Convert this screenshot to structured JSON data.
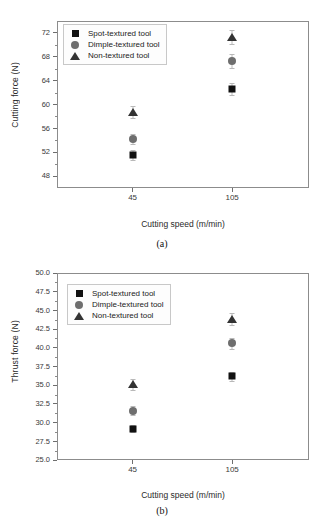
{
  "figure": {
    "panels": [
      {
        "caption": "(a)",
        "xlabel": "Cutting speed  (m/min)",
        "ylabel": "Cutting force (N)"
      },
      {
        "caption": "(b)",
        "xlabel": "Cutting speed  (m/min)",
        "ylabel": "Thrust force (N)"
      }
    ]
  },
  "legend": {
    "entries": [
      {
        "label": "Spot-textured tool",
        "marker": "square",
        "color": "#111111"
      },
      {
        "label": "Dimple-textured tool",
        "marker": "circle",
        "color": "#6e6e6e"
      },
      {
        "label": "Non-textured tool",
        "marker": "triangle",
        "color": "#333333"
      }
    ]
  },
  "chart_data": [
    {
      "type": "scatter",
      "panel": "(a)",
      "title": "",
      "xlabel": "Cutting speed  (m/min)",
      "ylabel": "Cutting force (N)",
      "categories": [
        "45",
        "105"
      ],
      "x": [
        45,
        105
      ],
      "xtick_labels": [
        "45",
        "105"
      ],
      "ytick_labels": [
        "48",
        "52",
        "56",
        "60",
        "64",
        "68",
        "72"
      ],
      "yticks": [
        48,
        52,
        56,
        60,
        64,
        68,
        72
      ],
      "ylim": [
        46,
        74
      ],
      "grid": false,
      "legend_position": "upper-left",
      "series": [
        {
          "name": "Spot-textured tool",
          "marker": "square",
          "color": "#111111",
          "values": [
            51.5,
            62.6
          ],
          "errors": [
            0.8,
            1.0
          ]
        },
        {
          "name": "Dimple-textured tool",
          "marker": "circle",
          "color": "#6e6e6e",
          "values": [
            54.2,
            67.3
          ],
          "errors": [
            0.9,
            1.1
          ]
        },
        {
          "name": "Non-textured tool",
          "marker": "triangle",
          "color": "#333333",
          "values": [
            58.8,
            71.3
          ],
          "errors": [
            1.0,
            1.2
          ]
        }
      ]
    },
    {
      "type": "scatter",
      "panel": "(b)",
      "title": "",
      "xlabel": "Cutting speed  (m/min)",
      "ylabel": "Thrust force (N)",
      "categories": [
        "45",
        "105"
      ],
      "x": [
        45,
        105
      ],
      "xtick_labels": [
        "45",
        "105"
      ],
      "ytick_labels": [
        "25.0",
        "27.5",
        "30.0",
        "32.5",
        "35.0",
        "37.5",
        "40.0",
        "42.5",
        "45.0",
        "47.5",
        "50.0"
      ],
      "yticks": [
        25.0,
        27.5,
        30.0,
        32.5,
        35.0,
        37.5,
        40.0,
        42.5,
        45.0,
        47.5,
        50.0
      ],
      "ylim": [
        25.0,
        50.0
      ],
      "grid": false,
      "legend_position": "upper-left",
      "series": [
        {
          "name": "Spot-textured tool",
          "marker": "square",
          "color": "#111111",
          "values": [
            29.2,
            36.2
          ],
          "errors": [
            0.5,
            0.6
          ]
        },
        {
          "name": "Dimple-textured tool",
          "marker": "circle",
          "color": "#6e6e6e",
          "values": [
            31.6,
            40.6
          ],
          "errors": [
            0.6,
            0.7
          ]
        },
        {
          "name": "Non-textured tool",
          "marker": "triangle",
          "color": "#333333",
          "values": [
            35.1,
            43.8
          ],
          "errors": [
            0.7,
            0.8
          ]
        }
      ]
    }
  ]
}
